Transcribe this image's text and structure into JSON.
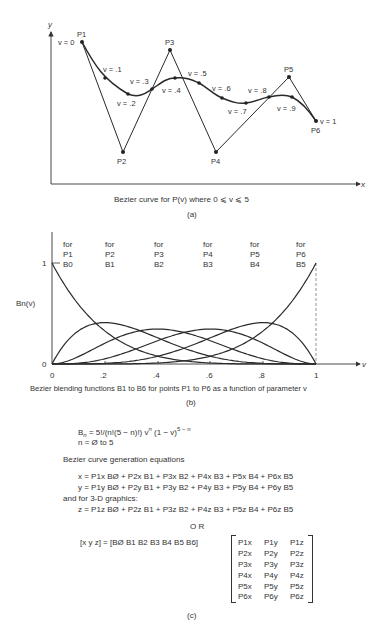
{
  "figure_a": {
    "axis_y_label": "y",
    "axis_x_label": "x",
    "caption": "Bezier curve for P(v) where 0 ⩽ v ⩽ 5",
    "sublabel": "(a)",
    "control_points": [
      {
        "label": "P1",
        "x": 82,
        "y": 42
      },
      {
        "label": "P2",
        "x": 123,
        "y": 152
      },
      {
        "label": "P3",
        "x": 170,
        "y": 50
      },
      {
        "label": "P4",
        "x": 216,
        "y": 152
      },
      {
        "label": "P5",
        "x": 289,
        "y": 77
      },
      {
        "label": "P6",
        "x": 316,
        "y": 121
      }
    ],
    "curve_points": [
      {
        "label": "v = 0",
        "x": 82,
        "y": 42
      },
      {
        "label": "v = .1",
        "x": 105,
        "y": 78
      },
      {
        "label": "v = .2",
        "x": 128,
        "y": 94
      },
      {
        "label": "v = .3",
        "x": 152,
        "y": 89
      },
      {
        "label": "v = .4",
        "x": 175,
        "y": 78
      },
      {
        "label": "v = .5",
        "x": 199,
        "y": 83
      },
      {
        "label": "v = .6",
        "x": 222,
        "y": 98
      },
      {
        "label": "v = .7",
        "x": 246,
        "y": 103
      },
      {
        "label": "v = .8",
        "x": 269,
        "y": 97
      },
      {
        "label": "v = .9",
        "x": 292,
        "y": 97
      },
      {
        "label": "v = 1",
        "x": 316,
        "y": 121
      }
    ]
  },
  "figure_b": {
    "ylabel": "Bn(v)",
    "xlabel": "v",
    "caption": "Bezier blending functions B1 to B6 for points P1 to P6 as a function of parameter v",
    "sublabel": "(b)",
    "y_ticks": [
      "0",
      "1"
    ],
    "x_ticks": [
      "0",
      ".2",
      ".4",
      ".6",
      ".8",
      "1"
    ],
    "function_labels": [
      {
        "for": "for",
        "point": "P1",
        "basis": "B0"
      },
      {
        "for": "for",
        "point": "P2",
        "basis": "B1"
      },
      {
        "for": "for",
        "point": "P3",
        "basis": "B2"
      },
      {
        "for": "for",
        "point": "P4",
        "basis": "B3"
      },
      {
        "for": "for",
        "point": "P5",
        "basis": "B4"
      },
      {
        "for": "for",
        "point": "P6",
        "basis": "B5"
      }
    ]
  },
  "chart_data": {
    "type": "line",
    "title": "Bezier blending functions B1 to B6 for points P1 to P6 as a function of parameter v",
    "xlabel": "v",
    "ylabel": "Bn(v)",
    "xlim": [
      0,
      1
    ],
    "ylim": [
      0,
      1
    ],
    "x": [
      0,
      0.1,
      0.2,
      0.3,
      0.4,
      0.5,
      0.6,
      0.7,
      0.8,
      0.9,
      1.0
    ],
    "series": [
      {
        "name": "B0 (P1)",
        "values": [
          1.0,
          0.59,
          0.328,
          0.168,
          0.078,
          0.031,
          0.01,
          0.002,
          0.0003,
          0.0,
          0.0
        ]
      },
      {
        "name": "B1 (P2)",
        "values": [
          0.0,
          0.328,
          0.41,
          0.36,
          0.259,
          0.156,
          0.077,
          0.028,
          0.006,
          0.0005,
          0.0
        ]
      },
      {
        "name": "B2 (P3)",
        "values": [
          0.0,
          0.073,
          0.205,
          0.309,
          0.346,
          0.313,
          0.23,
          0.132,
          0.051,
          0.008,
          0.0
        ]
      },
      {
        "name": "B3 (P4)",
        "values": [
          0.0,
          0.008,
          0.051,
          0.132,
          0.23,
          0.313,
          0.346,
          0.309,
          0.205,
          0.073,
          0.0
        ]
      },
      {
        "name": "B4 (P5)",
        "values": [
          0.0,
          0.0005,
          0.006,
          0.028,
          0.077,
          0.156,
          0.259,
          0.36,
          0.41,
          0.328,
          0.0
        ]
      },
      {
        "name": "B5 (P6)",
        "values": [
          0.0,
          0.0,
          0.0003,
          0.002,
          0.01,
          0.031,
          0.078,
          0.168,
          0.328,
          0.59,
          1.0
        ]
      }
    ]
  },
  "figure_c": {
    "formula_lhs": "B",
    "formula_sub": "n",
    "formula_rhs": " = 5!/(n!(5 − n)!) v",
    "formula_exp1": "n",
    "formula_tail": " (1 − v)",
    "formula_exp2": "5 − n",
    "range": "n = Ø to 5",
    "heading": "Bezier curve generation equations",
    "eq_x": "x = P1x BØ + P2x B1 + P3x B2 + P4x B3 + P5x B4 + P6x B5",
    "eq_y": "y = P1y BØ + P2y B1 + P3y B2 + P4y B3 + P5y B4 + P6y B5",
    "note_3d": "and for 3-D graphics:",
    "eq_z": "z = P1z BØ + P2z B1 + P3z B2 + P4z B3 + P5z B4 + P6z B5",
    "or": "O R",
    "matrix_lhs": "[x y z] = [BØ B1 B2 B3 B4 B5 B6]",
    "matrix": [
      [
        "P1x",
        "P1y",
        "P1z"
      ],
      [
        "P2x",
        "P2y",
        "P2z"
      ],
      [
        "P3x",
        "P3y",
        "P3z"
      ],
      [
        "P4x",
        "P4y",
        "P4z"
      ],
      [
        "P5x",
        "P5y",
        "P5z"
      ],
      [
        "P6x",
        "P6y",
        "P6z"
      ]
    ],
    "sublabel": "(c)"
  }
}
